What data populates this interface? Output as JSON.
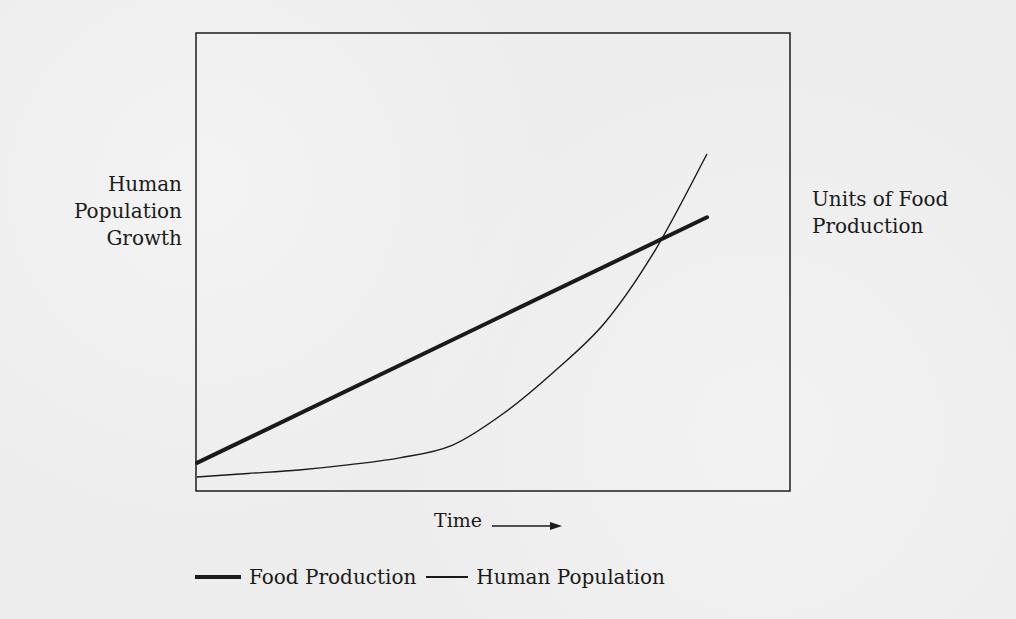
{
  "chart_data": {
    "type": "line",
    "title": "",
    "xlabel": "Time",
    "xlabel_arrow": "right-arrow",
    "ylabel_left": [
      "Human",
      "Population",
      "Growth"
    ],
    "ylabel_right": [
      "Units of Food",
      "Production"
    ],
    "grid": false,
    "legend_position": "bottom",
    "x_ticks": [],
    "y_ticks": [],
    "x": [
      0,
      10,
      20,
      30,
      40,
      50,
      60,
      70,
      80,
      90,
      100
    ],
    "series": [
      {
        "name": "Food Production",
        "style": "thick",
        "shape": "linear",
        "values": [
          8,
          15,
          22,
          29,
          36,
          43,
          50,
          57,
          64,
          71,
          78
        ]
      },
      {
        "name": "Human Population",
        "style": "thin",
        "shape": "exponential",
        "values": [
          4,
          5,
          6,
          7.5,
          9.5,
          13,
          22,
          34,
          48,
          69,
          96
        ]
      }
    ],
    "annotations": [
      {
        "type": "intersection",
        "x": 77,
        "y": 62,
        "note": "population overtakes food production"
      }
    ]
  },
  "legend": {
    "items": [
      {
        "label": "Food Production",
        "style": "thick"
      },
      {
        "label": "Human Population",
        "style": "thin"
      }
    ]
  },
  "colors": {
    "line": "#1a1a1a",
    "background": "#ededed",
    "frame": "#2a2a2a"
  }
}
